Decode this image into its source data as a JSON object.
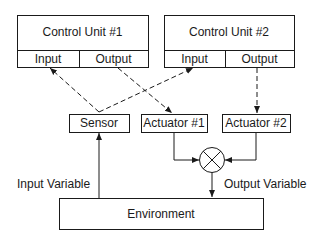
{
  "control_unit_1": {
    "title": "Control Unit #1",
    "input": "Input",
    "output": "Output"
  },
  "control_unit_2": {
    "title": "Control Unit #2",
    "input": "Input",
    "output": "Output"
  },
  "sensor": "Sensor",
  "actuator_1": "Actuator #1",
  "actuator_2": "Actuator #2",
  "environment": "Environment",
  "input_variable": "Input Variable",
  "output_variable": "Output Variable"
}
